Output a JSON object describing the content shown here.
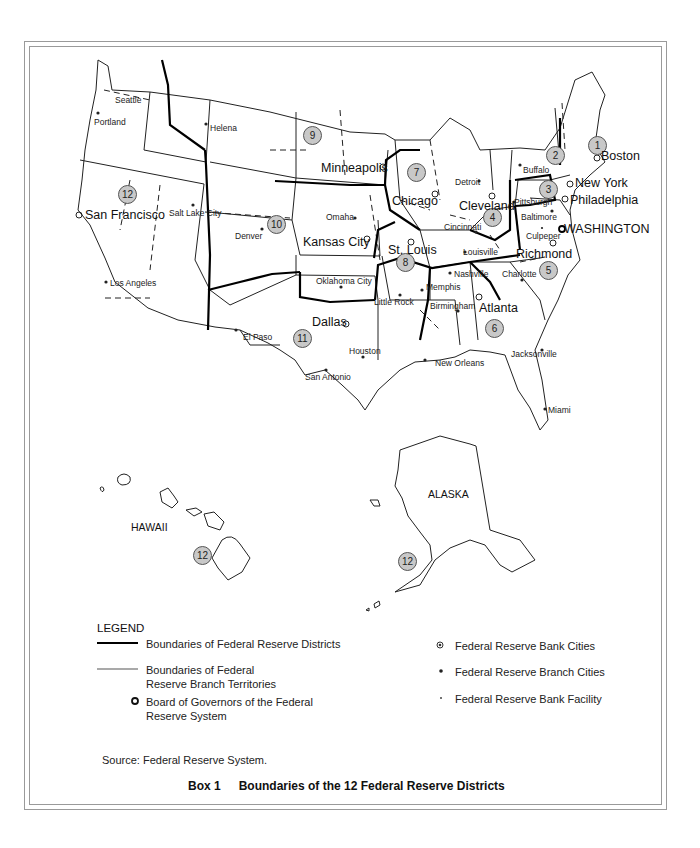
{
  "map": {
    "title": "Boundaries of the 12 Federal Reserve Districts",
    "box_label": "Box 1",
    "source": "Source:  Federal Reserve System.",
    "insets": {
      "hawaii": "HAWAII",
      "alaska": "ALASKA"
    },
    "district_numbers": [
      "1",
      "2",
      "3",
      "4",
      "5",
      "6",
      "7",
      "8",
      "9",
      "10",
      "11",
      "12"
    ],
    "hawaii_district": "12",
    "alaska_district": "12",
    "bank_cities": [
      "Boston",
      "New York",
      "Philadelphia",
      "Cleveland",
      "Richmond",
      "Atlanta",
      "Chicago",
      "St. Louis",
      "Minneapolis",
      "Kansas City",
      "Dallas",
      "San Francisco"
    ],
    "board_city": "WASHINGTON",
    "branch_cities": [
      "Seattle",
      "Portland",
      "Helena",
      "Salt Lake City",
      "Denver",
      "Omaha",
      "Los Angeles",
      "Oklahoma City",
      "El Paso",
      "San Antonio",
      "Houston",
      "Little Rock",
      "Memphis",
      "Nashville",
      "Birmingham",
      "New Orleans",
      "Jacksonville",
      "Miami",
      "Louisville",
      "Cincinnati",
      "Pittsburgh",
      "Buffalo",
      "Detroit",
      "Baltimore",
      "Charlotte"
    ],
    "facility_cities": [
      "Culpeper"
    ]
  },
  "legend": {
    "title": "LEGEND",
    "items": [
      {
        "symbol": "thick-line",
        "label": "Boundaries of Federal Reserve Districts"
      },
      {
        "symbol": "thin-line",
        "label": "Boundaries of Federal Reserve Branch Territories"
      },
      {
        "symbol": "hollow-circle",
        "label": "Board of Governors of the Federal Reserve System"
      },
      {
        "symbol": "bullseye-dot",
        "label": "Federal Reserve Bank Cities"
      },
      {
        "symbol": "dot",
        "label": "Federal Reserve Branch Cities"
      },
      {
        "symbol": "small-dot",
        "label": "Federal Reserve Bank Facility"
      }
    ]
  },
  "colors": {
    "frame": "#9a9a9a",
    "badge_fill": "#c8c8c8",
    "ink": "#111111"
  }
}
